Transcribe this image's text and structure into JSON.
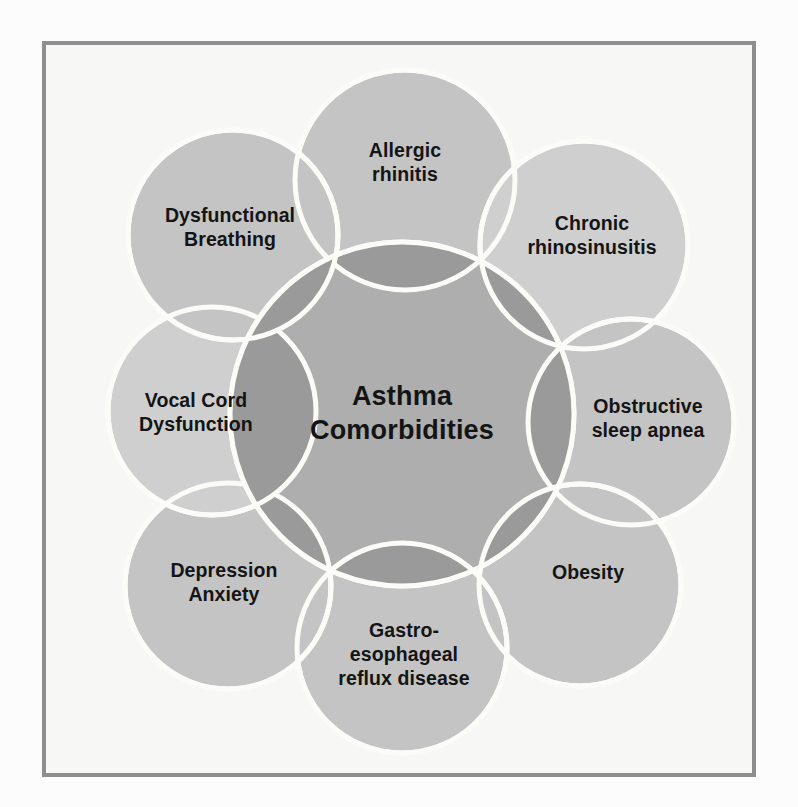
{
  "figure": {
    "title": "Asthma Comorbidities",
    "type": "venn-cluster-diagram",
    "frame": {
      "border_color": "#8e8e8e",
      "panel_background": "#f7f7f5",
      "page_background": "#fcfcfc"
    },
    "colors": {
      "center_circle_fill": "#a8a8a8",
      "satellite_circle_fill": "#c4c4c4",
      "satellite_circle_fill_light": "#cfcfcf",
      "overlap_fill": "#9a9a9a",
      "separator_stroke": "#fbfbf8",
      "text_color": "#141414"
    }
  },
  "center": {
    "label": "Asthma\nComorbidities",
    "line1": "Asthma",
    "line2": "Comorbidities",
    "cx": 402,
    "cy": 414,
    "r": 172
  },
  "satellites": [
    {
      "id": "allergic-rhinitis",
      "label": "Allergic\nrhinitis",
      "cx": 405,
      "cy": 180,
      "r": 110,
      "shade": "medium",
      "label_x": 405,
      "label_y": 163
    },
    {
      "id": "chronic-rhinosinusitis",
      "label": "Chronic\nrhinosinusitis",
      "cx": 584,
      "cy": 245,
      "r": 104,
      "shade": "light",
      "label_x": 592,
      "label_y": 236
    },
    {
      "id": "obstructive-sleep-apnea",
      "label": "Obstructive\nsleep apnea",
      "cx": 631,
      "cy": 422,
      "r": 103,
      "shade": "medium",
      "label_x": 648,
      "label_y": 419
    },
    {
      "id": "obesity",
      "label": "Obesity",
      "cx": 580,
      "cy": 585,
      "r": 101,
      "shade": "medium",
      "label_x": 588,
      "label_y": 573
    },
    {
      "id": "gastro-esophageal-reflux-disease",
      "label": "Gastro-\nesophageal\nreflux disease",
      "cx": 402,
      "cy": 648,
      "r": 105,
      "shade": "medium",
      "label_x": 404,
      "label_y": 655
    },
    {
      "id": "depression-anxiety",
      "label": "Depression\nAnxiety",
      "cx": 228,
      "cy": 586,
      "r": 103,
      "shade": "medium",
      "label_x": 224,
      "label_y": 583
    },
    {
      "id": "vocal-cord-dysfunction",
      "label": "Vocal Cord\nDysfunction",
      "cx": 212,
      "cy": 411,
      "r": 104,
      "shade": "light",
      "label_x": 196,
      "label_y": 413
    },
    {
      "id": "dysfunctional-breathing",
      "label": "Dysfunctional\nBreathing",
      "cx": 233,
      "cy": 235,
      "r": 105,
      "shade": "medium",
      "label_x": 230,
      "label_y": 228
    }
  ],
  "chart_data": {
    "type": "diagram",
    "title": "Asthma Comorbidities",
    "center_node": "Asthma Comorbidities",
    "categories": [
      "Allergic rhinitis",
      "Chronic rhinosinusitis",
      "Obstructive sleep apnea",
      "Obesity",
      "Gastro-esophageal reflux disease",
      "Depression Anxiety",
      "Vocal Cord Dysfunction",
      "Dysfunctional Breathing"
    ],
    "count": 8,
    "layout": "radial overlapping circles around one central circle",
    "legend": "none",
    "grid": false
  }
}
